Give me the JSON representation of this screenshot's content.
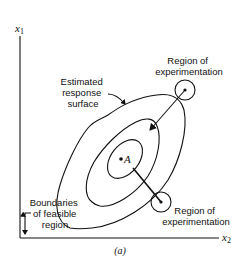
{
  "diagram": {
    "axes": {
      "y_label_var": "x",
      "y_label_sub": "1",
      "x_label_var": "x",
      "x_label_sub": "2"
    },
    "labels": {
      "estimated_surface": [
        "Estimated",
        "response",
        "surface"
      ],
      "region_top": [
        "Region of",
        "experimentation"
      ],
      "region_bottom": [
        "Region of",
        "experimentation"
      ],
      "boundaries": [
        "Boundaries",
        "of feasible",
        "region"
      ],
      "optimum_point": "A",
      "caption": "(a)"
    },
    "colors": {
      "ink": "#111111",
      "background": "#ffffff"
    }
  }
}
